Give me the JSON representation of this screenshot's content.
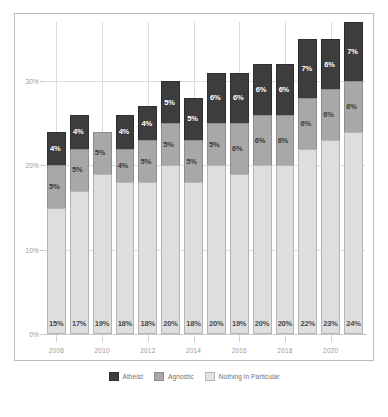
{
  "chart_data": {
    "type": "bar",
    "stacked": true,
    "title": "",
    "subtitle": "",
    "xlabel": "",
    "ylabel": "",
    "ylim": [
      0,
      37
    ],
    "yticks": [
      "0%",
      "10%",
      "20%",
      "30%"
    ],
    "ytick_values": [
      0,
      10,
      20,
      30
    ],
    "grid": true,
    "legend_position": "bottom",
    "categories": [
      "2008",
      "2009",
      "2010",
      "2011",
      "2012",
      "2013",
      "2014",
      "2015",
      "2016",
      "2017",
      "2018",
      "2019",
      "2020",
      "2021"
    ],
    "xtick_labels": [
      "2008",
      "2010",
      "2012",
      "2014",
      "2016",
      "2018",
      "2020"
    ],
    "series": [
      {
        "name": "Nothing in Particular",
        "color": "#dedede",
        "values": [
          15,
          17,
          19,
          18,
          18,
          20,
          18,
          20,
          19,
          20,
          20,
          22,
          23,
          24
        ],
        "labels": [
          "15%",
          "17%",
          "19%",
          "18%",
          "18%",
          "20%",
          "18%",
          "20%",
          "19%",
          "20%",
          "20%",
          "22%",
          "23%",
          "24%"
        ]
      },
      {
        "name": "Agnostic",
        "color": "#a8a8a8",
        "values": [
          5,
          5,
          5,
          4,
          5,
          5,
          5,
          5,
          6,
          6,
          6,
          6,
          6,
          6
        ],
        "labels": [
          "5%",
          "5%",
          "5%",
          "4%",
          "5%",
          "5%",
          "5%",
          "5%",
          "6%",
          "6%",
          "6%",
          "6%",
          "6%",
          "6%"
        ]
      },
      {
        "name": "Atheist",
        "color": "#3d3d3d",
        "values": [
          4,
          4,
          0,
          4,
          4,
          5,
          5,
          6,
          6,
          6,
          6,
          7,
          6,
          7
        ],
        "labels": [
          "4%",
          "4%",
          "",
          "4%",
          "4%",
          "5%",
          "5%",
          "6%",
          "6%",
          "6%",
          "6%",
          "7%",
          "6%",
          "7%"
        ]
      }
    ]
  },
  "legend": {
    "items": [
      {
        "label": "Atheist",
        "swatch": "atheist-swatch"
      },
      {
        "label": "Agnostic",
        "swatch": "agnostic-swatch"
      },
      {
        "label": "Nothing in Particular",
        "swatch": "nothing-swatch"
      }
    ]
  },
  "colors": {
    "atheist": "#3d3d3d",
    "agnostic": "#a8a8a8",
    "nothing": "#dedede",
    "grid": "#dcdcdc",
    "axis_text": "#9a9a9a",
    "frame": "#b9b9b9",
    "background": "#ffffff"
  }
}
